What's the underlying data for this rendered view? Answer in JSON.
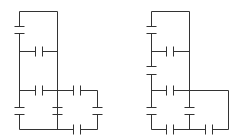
{
  "figure": {
    "colors": {
      "line": "#333333",
      "background": "#ffffff"
    },
    "circuits": [
      {
        "id": "left",
        "wires": [
          [
            19,
            11,
            57,
            11
          ],
          [
            57,
            11,
            57,
            129
          ],
          [
            19,
            11,
            19,
            26
          ],
          [
            19,
            33,
            19,
            107
          ],
          [
            19,
            114,
            19,
            129
          ],
          [
            19,
            51,
            35,
            51
          ],
          [
            42,
            51,
            57,
            51
          ],
          [
            19,
            90,
            35,
            90
          ],
          [
            42,
            90,
            73,
            90
          ],
          [
            80,
            90,
            97,
            90
          ],
          [
            97,
            90,
            97,
            107
          ],
          [
            97,
            114,
            97,
            129
          ],
          [
            57,
            90,
            57,
            107
          ],
          [
            57,
            114,
            57,
            129
          ],
          [
            19,
            129,
            73,
            129
          ],
          [
            80,
            129,
            97,
            129
          ]
        ],
        "capacitors_vertical": [
          [
            19,
            26,
            33
          ],
          [
            19,
            107,
            114
          ],
          [
            57,
            107,
            114
          ],
          [
            97,
            107,
            114
          ]
        ],
        "capacitors_horizontal": [
          [
            51,
            35,
            42
          ],
          [
            90,
            35,
            42
          ],
          [
            90,
            73,
            80
          ],
          [
            129,
            73,
            80
          ]
        ]
      },
      {
        "id": "right",
        "wires": [
          [
            151,
            11,
            189,
            11
          ],
          [
            189,
            11,
            189,
            107
          ],
          [
            189,
            114,
            189,
            129
          ],
          [
            151,
            11,
            151,
            26
          ],
          [
            151,
            33,
            151,
            66
          ],
          [
            151,
            74,
            151,
            107
          ],
          [
            151,
            114,
            151,
            129
          ],
          [
            151,
            51,
            166,
            51
          ],
          [
            173,
            51,
            189,
            51
          ],
          [
            151,
            90,
            166,
            90
          ],
          [
            173,
            90,
            228,
            90
          ],
          [
            228,
            90,
            228,
            129
          ],
          [
            151,
            129,
            166,
            129
          ],
          [
            173,
            129,
            205,
            129
          ],
          [
            212,
            129,
            228,
            129
          ]
        ],
        "capacitors_vertical": [
          [
            151,
            26,
            33
          ],
          [
            151,
            66,
            74
          ],
          [
            151,
            107,
            114
          ],
          [
            189,
            107,
            114
          ]
        ],
        "capacitors_horizontal": [
          [
            51,
            166,
            173
          ],
          [
            90,
            166,
            173
          ],
          [
            129,
            166,
            173
          ],
          [
            129,
            205,
            212
          ]
        ]
      }
    ]
  }
}
